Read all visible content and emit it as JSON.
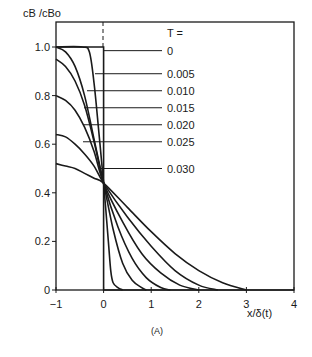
{
  "chart_data": {
    "type": "line",
    "title": "",
    "caption": "(A)",
    "xlabel": "x/δ(t)",
    "ylabel": "cB /cBo",
    "xlim": [
      -1,
      4
    ],
    "ylim": [
      0,
      1.0
    ],
    "x_ticks": [
      "-1",
      "0",
      "1",
      "2",
      "3",
      "4"
    ],
    "y_ticks": [
      "0",
      "0.2",
      "0.4",
      "0.6",
      "0.8",
      "1.0"
    ],
    "grid": false,
    "legend_title": "T =",
    "legend_position": "right, leader lines",
    "series": [
      {
        "name": "0",
        "leader_y": 0.985,
        "x": [
          -1,
          -0.05,
          -0.05,
          0,
          0,
          4
        ],
        "y": [
          1.0,
          1.0,
          1.0,
          1.0,
          0,
          0
        ]
      },
      {
        "name": "0.005",
        "leader_y": 0.89,
        "x": [
          -1,
          -0.45,
          -0.3,
          -0.2,
          -0.1,
          0,
          0.1,
          0.15,
          0.2,
          0.3,
          0.4
        ],
        "y": [
          1.0,
          1.0,
          0.98,
          0.85,
          0.65,
          0.44,
          0.2,
          0.08,
          0.03,
          0.01,
          0
        ]
      },
      {
        "name": "0.010",
        "leader_y": 0.82,
        "x": [
          -1,
          -0.8,
          -0.6,
          -0.4,
          -0.2,
          0,
          0.2,
          0.4,
          0.6,
          0.8,
          0.9
        ],
        "y": [
          1.0,
          0.98,
          0.92,
          0.8,
          0.62,
          0.44,
          0.25,
          0.11,
          0.04,
          0.01,
          0
        ]
      },
      {
        "name": "0.015",
        "leader_y": 0.75,
        "x": [
          -1,
          -0.8,
          -0.6,
          -0.4,
          -0.2,
          0,
          0.3,
          0.6,
          0.9,
          1.2,
          1.4
        ],
        "y": [
          0.95,
          0.92,
          0.86,
          0.76,
          0.61,
          0.44,
          0.26,
          0.13,
          0.05,
          0.01,
          0
        ]
      },
      {
        "name": "0.020",
        "leader_y": 0.68,
        "x": [
          -1,
          -0.8,
          -0.6,
          -0.4,
          -0.2,
          0,
          0.4,
          0.8,
          1.2,
          1.6,
          2.0
        ],
        "y": [
          0.8,
          0.78,
          0.74,
          0.67,
          0.57,
          0.44,
          0.28,
          0.15,
          0.07,
          0.02,
          0
        ]
      },
      {
        "name": "0.025",
        "leader_y": 0.61,
        "x": [
          -1,
          -0.8,
          -0.6,
          -0.4,
          -0.2,
          0,
          0.5,
          1.0,
          1.5,
          2.0,
          2.4
        ],
        "y": [
          0.64,
          0.63,
          0.6,
          0.56,
          0.51,
          0.44,
          0.3,
          0.18,
          0.08,
          0.02,
          0
        ]
      },
      {
        "name": "0.030",
        "leader_y": 0.5,
        "x": [
          -1,
          -0.8,
          -0.6,
          -0.4,
          -0.2,
          0,
          0.5,
          1.0,
          1.5,
          2.0,
          2.5,
          3.0
        ],
        "y": [
          0.52,
          0.51,
          0.5,
          0.48,
          0.46,
          0.44,
          0.34,
          0.24,
          0.15,
          0.08,
          0.03,
          0
        ]
      }
    ],
    "annotations": [
      "dashed vertical line at x=0 above y=1.0",
      "curves intersect near (0, 0.44)"
    ]
  }
}
